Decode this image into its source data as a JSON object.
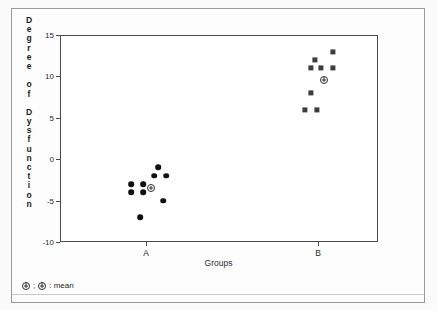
{
  "chart_data": {
    "type": "scatter",
    "title": "",
    "xlabel": "Groups",
    "ylabel": "Degree of Dysfunction",
    "ylabel_letters": [
      "D",
      "e",
      "g",
      "r",
      "e",
      "e",
      "",
      "o",
      "f",
      "",
      "D",
      "y",
      "s",
      "f",
      "u",
      "n",
      "c",
      "t",
      "i",
      "o",
      "n"
    ],
    "categories": [
      "A",
      "B"
    ],
    "ylim": [
      -10,
      15
    ],
    "yticks": [
      15,
      10,
      5,
      0,
      -5,
      -10
    ],
    "ytick_labels": [
      "15",
      "10",
      "5",
      "0",
      "-5",
      "-10"
    ],
    "grid": false,
    "legend_position": "below-axes-left",
    "series": [
      {
        "name": "A",
        "category": "A",
        "marker": "circle",
        "color": "#101010",
        "points": [
          {
            "x_offset": -0.1,
            "y": -3
          },
          {
            "x_offset": -0.02,
            "y": -3
          },
          {
            "x_offset": -0.1,
            "y": -4
          },
          {
            "x_offset": -0.02,
            "y": -4
          },
          {
            "x_offset": 0.08,
            "y": -1
          },
          {
            "x_offset": 0.055,
            "y": -2
          },
          {
            "x_offset": 0.135,
            "y": -2
          },
          {
            "x_offset": 0.115,
            "y": -5
          },
          {
            "x_offset": -0.04,
            "y": -7
          }
        ],
        "mean": -3.5,
        "mean_x_offset": 0.035
      },
      {
        "name": "B",
        "category": "B",
        "marker": "square",
        "color": "#3d3d3d",
        "points": [
          {
            "x_offset": 0.1,
            "y": 13
          },
          {
            "x_offset": -0.02,
            "y": 12
          },
          {
            "x_offset": -0.045,
            "y": 11
          },
          {
            "x_offset": 0.022,
            "y": 11
          },
          {
            "x_offset": 0.098,
            "y": 11
          },
          {
            "x_offset": -0.045,
            "y": 8
          },
          {
            "x_offset": -0.085,
            "y": 6
          },
          {
            "x_offset": -0.005,
            "y": 6
          }
        ],
        "mean": 9.6,
        "mean_x_offset": 0.04
      }
    ]
  },
  "legend": {
    "symbol_name": "circle-plus-mean-marker",
    "separator": ";",
    "label": ": mean"
  }
}
